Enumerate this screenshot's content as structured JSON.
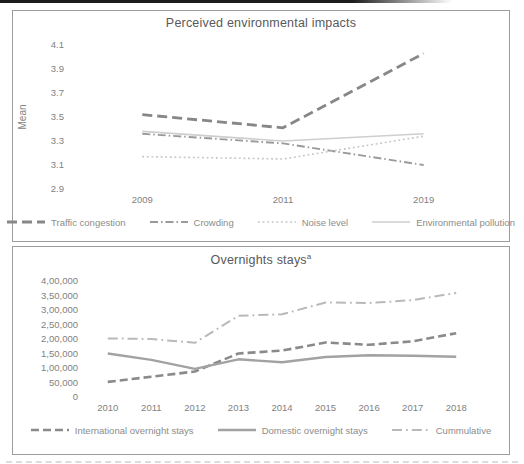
{
  "figure": {
    "background": "#ffffff",
    "panel_border_color": "#9c9c9c",
    "title_color": "#595959",
    "tick_label_color": "#7f7f7f",
    "legend_label_color": "#8c8c8c"
  },
  "chart_data": [
    {
      "type": "line",
      "title": "Perceived environmental impacts",
      "xlabel": "",
      "ylabel": "Mean",
      "categories": [
        "2009",
        "2011",
        "2019"
      ],
      "ylim": [
        2.9,
        4.1
      ],
      "grid": false,
      "legend_position": "bottom",
      "yticks": [
        {
          "v": 2.9,
          "label": "2.9"
        },
        {
          "v": 3.1,
          "label": "3.1"
        },
        {
          "v": 3.3,
          "label": "3.3"
        },
        {
          "v": 3.5,
          "label": "3.5"
        },
        {
          "v": 3.7,
          "label": "3.7"
        },
        {
          "v": 3.9,
          "label": "3.9"
        },
        {
          "v": 4.1,
          "label": "4.1"
        }
      ],
      "series": [
        {
          "name": "Traffic congestion",
          "values": [
            3.52,
            3.41,
            4.03
          ],
          "color": "#878787",
          "dash": "10 5",
          "width": 2.8
        },
        {
          "name": "Crowding",
          "values": [
            3.36,
            3.28,
            3.1
          ],
          "color": "#9a9a9a",
          "dash": "8 3 1.5 3",
          "width": 1.9
        },
        {
          "name": "Noise level",
          "values": [
            3.17,
            3.15,
            3.34
          ],
          "color": "#c3c3c3",
          "dash": "1.8 2.8",
          "width": 1.6
        },
        {
          "name": "Environmental pollution",
          "values": [
            3.38,
            3.3,
            3.36
          ],
          "color": "#cecece",
          "dash": "",
          "width": 1.6
        }
      ],
      "layout": {
        "width": 494,
        "height": 176,
        "margins": {
          "left": 58,
          "right": 14,
          "top": 12,
          "bottom": 20
        }
      }
    },
    {
      "type": "line",
      "title": "Overnights stays",
      "title_superscript": "a",
      "xlabel": "",
      "ylabel": "",
      "categories": [
        "2010",
        "2011",
        "2012",
        "2013",
        "2014",
        "2015",
        "2016",
        "2017",
        "2018"
      ],
      "ylim": [
        0,
        400000
      ],
      "grid": false,
      "legend_position": "bottom",
      "yticks": [
        {
          "v": 0,
          "label": "0"
        },
        {
          "v": 50000,
          "label": "50,000"
        },
        {
          "v": 100000,
          "label": "1,00,000"
        },
        {
          "v": 150000,
          "label": "1,50,000"
        },
        {
          "v": 200000,
          "label": "2,00,000"
        },
        {
          "v": 250000,
          "label": "2,50,000"
        },
        {
          "v": 300000,
          "label": "3,00,000"
        },
        {
          "v": 350000,
          "label": "3,50,000"
        },
        {
          "v": 400000,
          "label": "4,00,000"
        }
      ],
      "series": [
        {
          "name": "International overnight stays",
          "values": [
            52000,
            70000,
            88000,
            150000,
            160000,
            188000,
            180000,
            192000,
            220000
          ],
          "color": "#8a8a8a",
          "dash": "8 4",
          "width": 2.6
        },
        {
          "name": "Domestic overnight stays",
          "values": [
            150000,
            128000,
            97000,
            130000,
            120000,
            138000,
            144000,
            142000,
            139000
          ],
          "color": "#a2a2a2",
          "dash": "",
          "width": 2.4
        },
        {
          "name": "Cummulative",
          "values": [
            202000,
            200000,
            187000,
            280000,
            285000,
            326000,
            324000,
            334000,
            359000
          ],
          "color": "#b9b9b9",
          "dash": "10 4 1.8 4",
          "width": 2.0
        }
      ],
      "layout": {
        "width": 494,
        "height": 146,
        "margins": {
          "left": 72,
          "right": 30,
          "top": 11,
          "bottom": 19
        }
      }
    }
  ]
}
